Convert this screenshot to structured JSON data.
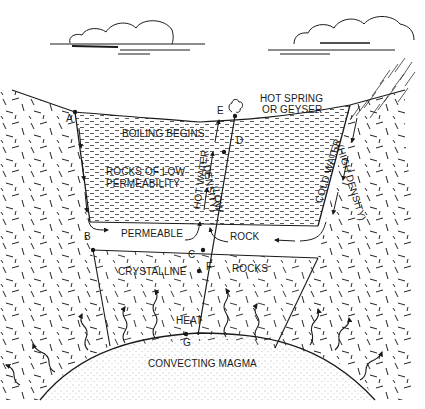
{
  "diagram": {
    "type": "geothermal-system-cross-section",
    "style": "black-and-white line drawing",
    "colors": {
      "ink": "#1a1a1a",
      "background": "#ffffff"
    }
  },
  "labels": {
    "hot_spring": "HOT SPRING",
    "or_geyser": "OR GEYSER",
    "boiling_begins": "BOILING BEGINS",
    "rocks_of_low": "ROCKS OF LOW",
    "permeability": "PERMEABILITY",
    "hot_water": "HOT WATER",
    "low": "(LOW",
    "density": "DENSITY)",
    "cold_water": "COLD WATER",
    "high_density": "(HIGH DENSITY)",
    "permeable": "PERMEABLE",
    "rock": "ROCK",
    "crystalline": "CRYSTALLINE",
    "rocks": "ROCKS",
    "heat": "HEAT",
    "convecting_magma": "CONVECTING MAGMA"
  },
  "points": {
    "A": "A",
    "B": "B",
    "C": "C",
    "D": "D",
    "E": "E",
    "F": "F",
    "G": "G"
  },
  "elements": {
    "clouds": 2,
    "rain": true,
    "steam_plume_at_E": true
  }
}
